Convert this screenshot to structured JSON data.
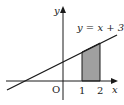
{
  "diagram": {
    "type": "coordinate-plot",
    "line_equation": "y = x + 3",
    "axes": {
      "x_label": "x",
      "y_label": "y",
      "origin_label": "O"
    },
    "x_ticks": [
      "1",
      "2"
    ],
    "shaded_region": {
      "from_x": 1,
      "to_x": 2,
      "bounded_by": "y = x + 3 and x-axis",
      "color": "#a0a0a0"
    },
    "colors": {
      "line": "#1a1a1a",
      "shade": "#a0a0a0",
      "background": "#ffffff"
    }
  }
}
